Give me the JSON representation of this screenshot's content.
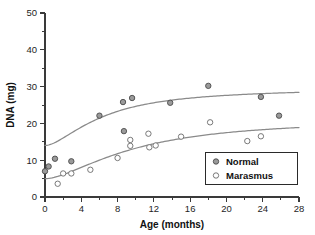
{
  "chart_data": {
    "type": "scatter",
    "title": "",
    "xlabel": "Age (months)",
    "ylabel": "DNA (mg)",
    "xlim": [
      0,
      28
    ],
    "ylim": [
      0,
      50
    ],
    "xticks": [
      0,
      4,
      8,
      12,
      16,
      20,
      24,
      28
    ],
    "yticks": [
      0,
      10,
      20,
      30,
      40,
      50
    ],
    "x_minor_step": 2,
    "y_minor_step": 5,
    "grid": false,
    "legend_position": "lower-right",
    "series": [
      {
        "name": "Normal",
        "marker": "filled-circle",
        "color": "#9a9a9a",
        "points": [
          [
            0.0,
            7.0
          ],
          [
            0.4,
            8.3
          ],
          [
            1.1,
            10.4
          ],
          [
            2.9,
            9.7
          ],
          [
            6.0,
            22.1
          ],
          [
            8.6,
            25.8
          ],
          [
            9.6,
            26.9
          ],
          [
            8.7,
            17.9
          ],
          [
            13.8,
            25.6
          ],
          [
            18.0,
            30.2
          ],
          [
            23.8,
            27.2
          ],
          [
            25.8,
            22.1
          ]
        ],
        "fit_curve": {
          "description": "saturating growth curve",
          "y_at_x0": 14.0,
          "plateau": 30.6,
          "half_saturation_months": 4.2
        }
      },
      {
        "name": "Marasmus",
        "marker": "open-circle",
        "color": "#ffffff",
        "points": [
          [
            1.4,
            3.6
          ],
          [
            2.0,
            6.4
          ],
          [
            2.9,
            6.4
          ],
          [
            5.0,
            7.4
          ],
          [
            8.0,
            10.6
          ],
          [
            9.4,
            15.5
          ],
          [
            9.4,
            13.9
          ],
          [
            11.4,
            17.2
          ],
          [
            11.5,
            13.5
          ],
          [
            12.2,
            14.0
          ],
          [
            15.0,
            16.4
          ],
          [
            18.2,
            20.3
          ],
          [
            22.3,
            15.2
          ],
          [
            23.8,
            16.5
          ]
        ],
        "fit_curve": {
          "description": "saturating growth curve",
          "y_at_x0": 5.0,
          "plateau": 22.1,
          "half_saturation_months": 6.5
        }
      }
    ],
    "legend_entries": [
      {
        "label": "Normal",
        "marker": "filled-circle"
      },
      {
        "label": "Marasmus",
        "marker": "open-circle"
      }
    ]
  },
  "axes": {
    "x_title": "Age (months)",
    "y_title": "DNA (mg)",
    "x_tick_labels": [
      "0",
      "4",
      "8",
      "12",
      "16",
      "20",
      "24",
      "28"
    ],
    "y_tick_labels": [
      "0",
      "10",
      "20",
      "30",
      "40",
      "50"
    ]
  },
  "legend": {
    "normal_label": "Normal",
    "marasmus_label": "Marasmus"
  },
  "colors": {
    "axis": "#3a3a3a",
    "curve": "#8a8a8a",
    "normal_marker_fill": "#9a9a9a",
    "normal_marker_stroke": "#4a4a4a",
    "marasmus_marker_fill": "#ffffff",
    "marasmus_marker_stroke": "#6a6a6a",
    "text": "#111111",
    "background": "#ffffff"
  }
}
